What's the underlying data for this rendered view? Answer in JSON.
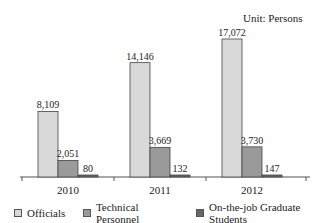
{
  "chart_data": {
    "type": "bar",
    "title": "",
    "unit_label": "Unit: Persons",
    "xlabel": "",
    "ylabel": "",
    "categories": [
      "2010",
      "2011",
      "2012"
    ],
    "series": [
      {
        "name": "Officials",
        "values": [
          8109,
          14146,
          17072
        ],
        "color": "#d9d9d9",
        "labels": [
          "8,109",
          "14,146",
          "17,072"
        ]
      },
      {
        "name": "Technical Personnel",
        "values": [
          2051,
          3669,
          3730
        ],
        "color": "#9a9a9a",
        "labels": [
          "2,051",
          "3,669",
          "3,730"
        ]
      },
      {
        "name": "On-the-job Graduate Students",
        "values": [
          80,
          132,
          147
        ],
        "color": "#666666",
        "labels": [
          "80",
          "132",
          "147"
        ]
      }
    ],
    "ylim": [
      0,
      17500
    ],
    "grid": false,
    "legend_position": "bottom",
    "show_y_axis": false
  }
}
